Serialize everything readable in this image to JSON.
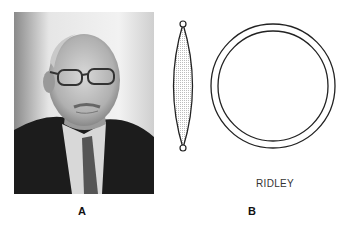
{
  "figure": {
    "panel_a": {
      "label": "A",
      "image": "portrait-photo-elderly-man-glasses-suit"
    },
    "panel_b": {
      "label": "B",
      "caption": "RIDLEY",
      "elements": [
        "lens-side-profile",
        "lens-front-view-ring"
      ]
    }
  }
}
